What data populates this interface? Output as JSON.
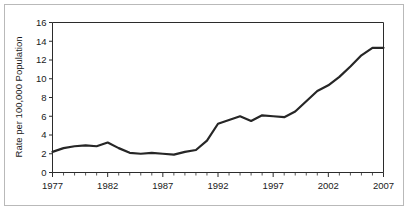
{
  "chart_data": {
    "type": "line",
    "title": "",
    "xlabel": "",
    "ylabel": "Rate per 100,000 Population",
    "xlim": [
      1977,
      2007
    ],
    "ylim": [
      0,
      16
    ],
    "grid": false,
    "legend": "none",
    "y_ticks": [
      0,
      2,
      4,
      6,
      8,
      10,
      12,
      14,
      16
    ],
    "y_tick_labels": [
      "0",
      "2",
      "4",
      "6",
      "8",
      "10",
      "12",
      "14",
      "16"
    ],
    "x_ticks": [
      1977,
      1982,
      1987,
      1992,
      1997,
      2002,
      2007
    ],
    "x_tick_labels": [
      "1977",
      "1982",
      "1987",
      "1992",
      "1997",
      "2002",
      "2007"
    ],
    "x_minor_tick_interval": 1,
    "series": [
      {
        "name": "Rate",
        "color": "#262626",
        "x": [
          1977,
          1978,
          1979,
          1980,
          1981,
          1982,
          1983,
          1984,
          1985,
          1986,
          1987,
          1988,
          1989,
          1990,
          1991,
          1992,
          1993,
          1994,
          1995,
          1996,
          1997,
          1998,
          1999,
          2000,
          2001,
          2002,
          2003,
          2004,
          2005,
          2006,
          2007
        ],
        "values": [
          2.2,
          2.6,
          2.8,
          2.9,
          2.8,
          3.2,
          2.6,
          2.1,
          2.0,
          2.1,
          2.0,
          1.9,
          2.2,
          2.4,
          3.4,
          5.2,
          5.6,
          6.0,
          5.5,
          6.1,
          6.0,
          5.9,
          6.5,
          7.6,
          8.7,
          9.3,
          10.2,
          11.3,
          12.5,
          13.3,
          13.3
        ]
      }
    ]
  },
  "axes": {
    "y_axis_title": "Rate per 100,000 Population"
  }
}
